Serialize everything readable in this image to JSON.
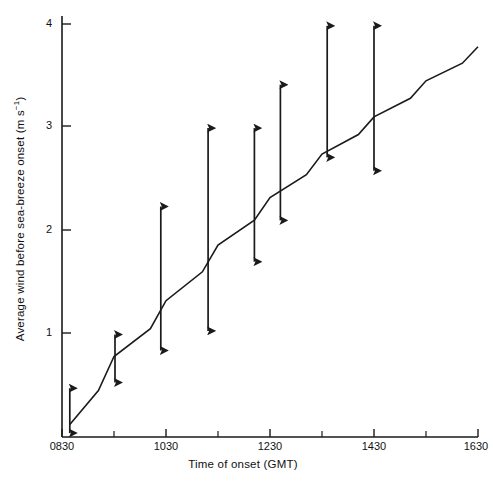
{
  "figure": {
    "background": "#ffffff",
    "ink": "#1a1a1a"
  },
  "axes": {
    "xlabel": "Time of onset (GMT)",
    "ylabel_prefix": "Average wind before sea-breeze onset (m s",
    "ylabel_exponent": "−1",
    "ylabel_suffix": ")",
    "ylabel_full": "Average wind before sea-breeze onset (m s⁻¹)",
    "xticks": [
      "0830",
      "1030",
      "1230",
      "1430",
      "1630"
    ],
    "yticks": [
      "1",
      "2",
      "3",
      "4"
    ]
  },
  "chart_data": {
    "type": "line",
    "title": "",
    "xlabel": "Time of onset (GMT)",
    "ylabel": "Average wind before sea-breeze onset (m s^-1)",
    "xlim": [
      830,
      1630
    ],
    "ylim": [
      0,
      4.15
    ],
    "xtick_labels": [
      "0830",
      "1030",
      "1230",
      "1430",
      "1630"
    ],
    "xtick_values": [
      830,
      1030,
      1230,
      1430,
      1630
    ],
    "xminor_values": [
      930,
      1130,
      1330,
      1530
    ],
    "ytick_values": [
      1,
      2,
      3,
      4
    ],
    "grid": false,
    "legend": null,
    "series": [
      {
        "name": "Average wind before sea-breeze onset",
        "type": "line",
        "x": [
          845,
          900,
          930,
          1000,
          1030,
          1100,
          1130,
          1200,
          1230,
          1300,
          1330,
          1400,
          1430,
          1500,
          1530,
          1600,
          1630
        ],
        "y": [
          0.12,
          0.45,
          0.78,
          1.05,
          1.32,
          1.6,
          1.86,
          2.1,
          2.32,
          2.54,
          2.74,
          2.93,
          3.1,
          3.28,
          3.45,
          3.62,
          3.78
        ]
      },
      {
        "name": "Spread bars (double-headed arrows)",
        "type": "errorbar",
        "x": [
          845,
          932,
          1020,
          1111,
          1200,
          1250,
          1340,
          1430
        ],
        "center": [
          0.12,
          0.78,
          1.25,
          1.9,
          2.25,
          2.6,
          3.0,
          3.2
        ],
        "upper": [
          0.54,
          1.06,
          2.3,
          3.06,
          3.06,
          3.48,
          4.05,
          4.05
        ],
        "lower": [
          -0.03,
          0.46,
          0.77,
          0.96,
          1.63,
          2.03,
          2.64,
          2.51
        ]
      }
    ]
  }
}
